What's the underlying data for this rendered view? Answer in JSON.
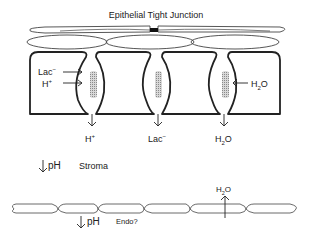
{
  "title": "Epithelial Tight Junction",
  "apical_labels": {
    "lac_in": "Lac",
    "lac_in_sup": "−",
    "h_in": "H",
    "h_in_sup": "+",
    "water_in_h": "H",
    "water_in_sub": "2",
    "water_in_o": "O"
  },
  "outflow_labels": [
    {
      "base": "H",
      "sup": "+",
      "sub": "",
      "tail": ""
    },
    {
      "base": "Lac",
      "sup": "−",
      "sub": "",
      "tail": ""
    },
    {
      "base": "H",
      "sup": "",
      "sub": "2",
      "tail": "O"
    }
  ],
  "stroma": {
    "arrow": "↓",
    "ph": "pH",
    "label": "Stroma"
  },
  "endothelium": {
    "arrow": "↓",
    "ph": "pH",
    "label": "Endo?",
    "water_h": "H",
    "water_sub": "2",
    "water_o": "O"
  },
  "colors": {
    "stroke": "#222222",
    "thin_stroke": "#444444",
    "pump": "#9a9a9a",
    "junction": "#111111"
  }
}
